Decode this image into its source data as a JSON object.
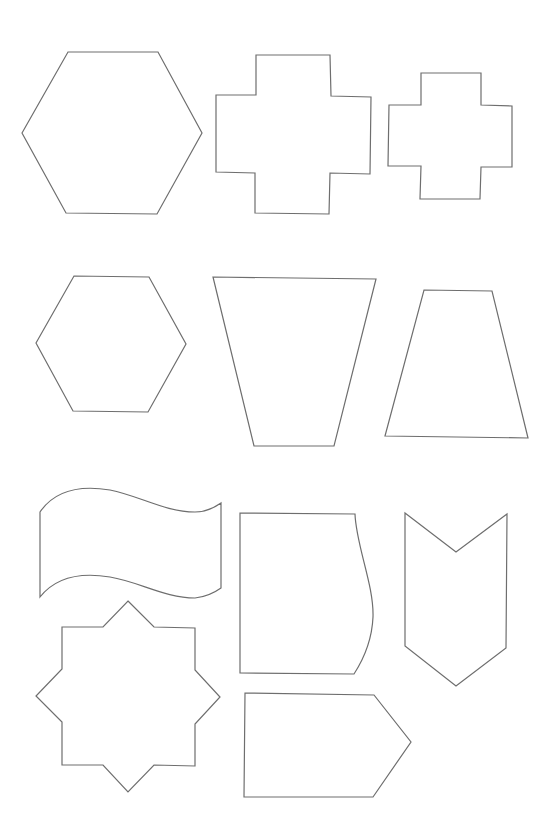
{
  "page": {
    "background": "#ffffff",
    "stroke_color": "#6e6e6e"
  },
  "shapes": [
    {
      "id": "hexagon-large",
      "type": "hexagon",
      "points": "22,133 68,52 158,52 202,133 157,214 66,213"
    },
    {
      "id": "cross-large",
      "type": "cross",
      "points": "256,55 330,55 331,96 371,97 370,174 330,173 329,214 255,213 255,173 216,172 216,95 256,95"
    },
    {
      "id": "cross-small",
      "type": "cross",
      "points": "421,73 481,73 481,105 512,106 512,167 481,167 480,199 420,199 421,166 388,166 389,105 421,105"
    },
    {
      "id": "hexagon-medium",
      "type": "hexagon",
      "points": "36,343 74,276 149,277 186,344 148,412 73,411"
    },
    {
      "id": "trapezoid-inverted",
      "type": "trapezoid",
      "points": "213,277 376,279 334,446 254,446"
    },
    {
      "id": "trapezoid-upright",
      "type": "trapezoid",
      "points": "424,290 492,291 528,438 385,436"
    },
    {
      "id": "wavy-flag",
      "type": "flag",
      "path": "M40,512 C55,490 80,485 110,490 C140,496 165,512 195,512 C205,512 214,508 221,503 L221,588 C214,593 205,597 195,598 C165,598 140,582 110,577 C80,572 55,578 40,597 Z"
    },
    {
      "id": "curved-side-rect",
      "type": "curved-rectangle",
      "path": "M240,513 L355,514 C356,545 374,585 373,617 C372,640 365,657 354,674 L240,673 Z"
    },
    {
      "id": "chevron-down",
      "type": "chevron",
      "points": "405,513 456,552 507,514 506,648 456,686 405,646"
    },
    {
      "id": "eight-point-star",
      "type": "star",
      "points": "128,601 154,627 195,628 195,670 220,697 195,724 195,766 154,765 128,792 103,765 62,765 62,722 36,696 62,669 62,627 103,627"
    },
    {
      "id": "tag-pentagon",
      "type": "tag",
      "points": "245,693 374,695 411,742 373,797 244,797"
    }
  ]
}
